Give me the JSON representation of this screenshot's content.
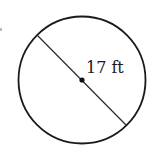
{
  "diagram": {
    "shape": "circle",
    "measurement": "diameter",
    "label": "17 ft",
    "colors": {
      "stroke": "#1a1a1a",
      "background": "#ffffff"
    }
  }
}
